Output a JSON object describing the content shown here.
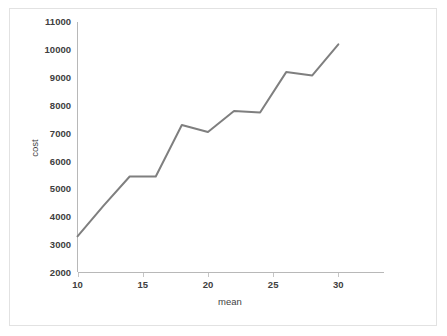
{
  "chart_data": {
    "type": "line",
    "title": "",
    "xlabel": "mean",
    "ylabel": "cost",
    "xlim": [
      10,
      33.5
    ],
    "ylim": [
      2000,
      11000
    ],
    "grid": false,
    "legend": null,
    "x": [
      10,
      12,
      14,
      16,
      18,
      20,
      22,
      24,
      26,
      28,
      30
    ],
    "series": [
      {
        "name": "cost",
        "color": "#7f7f7f",
        "values": [
          3300,
          4400,
          5450,
          5450,
          7300,
          7050,
          7800,
          7750,
          9200,
          9080,
          10200
        ]
      }
    ],
    "xticks": [
      10,
      15,
      20,
      25,
      30
    ],
    "xtick_labels": [
      "10",
      "15",
      "20",
      "25",
      "30"
    ],
    "yticks": [
      2000,
      3000,
      4000,
      5000,
      6000,
      7000,
      8000,
      9000,
      10000,
      11000
    ],
    "ytick_labels": [
      "2000",
      "3000",
      "4000",
      "5000",
      "6000",
      "7000",
      "8000",
      "9000",
      "10000",
      "11000"
    ]
  },
  "figure": {
    "background_color": "#ffffff",
    "border_color": "#e2e2e2",
    "axis_color": "#b8b8b8",
    "line_color": "#7f7f7f",
    "text_color": "#404040"
  }
}
